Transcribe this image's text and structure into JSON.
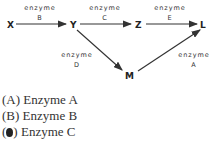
{
  "diagram": {
    "nodes": {
      "X": "X",
      "Y": "Y",
      "Z": "Z",
      "L": "L",
      "M": "M"
    },
    "edges": [
      {
        "from": "X",
        "to": "Y",
        "word": "enzyme",
        "letter": "B"
      },
      {
        "from": "Y",
        "to": "Z",
        "word": "enzyme",
        "letter": "C"
      },
      {
        "from": "Z",
        "to": "L",
        "word": "enzyme",
        "letter": "E"
      },
      {
        "from": "Y",
        "to": "M",
        "word": "enzyme",
        "letter": "D"
      },
      {
        "from": "M",
        "to": "L",
        "word": "enzyme",
        "letter": "A"
      }
    ]
  },
  "options": [
    {
      "letter": "(A)",
      "text": "Enzyme A",
      "selected": false
    },
    {
      "letter": "(B)",
      "text": "Enzyme B",
      "selected": false
    },
    {
      "letter": "(C)",
      "text": "Enzyme C",
      "selected": true
    }
  ]
}
